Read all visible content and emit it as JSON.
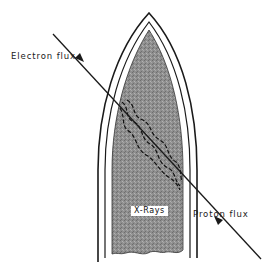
{
  "figure": {
    "labels": {
      "electron_flux": "Electron flux",
      "proton_flux": "Proton flux",
      "xrays": "X-Rays"
    },
    "colors": {
      "background": "#ffffff",
      "outline": "#1a1a1a",
      "body_fill": "#8d8d8d"
    }
  }
}
